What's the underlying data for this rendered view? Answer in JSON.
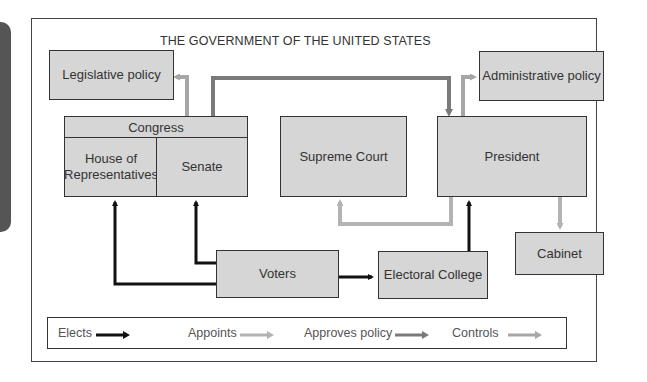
{
  "diagram": {
    "title": "THE GOVERNMENT OF THE UNITED STATES",
    "nodes": {
      "legislative_policy": "Legislative policy",
      "administrative_policy": "Administrative policy",
      "congress": "Congress",
      "house": "House of Representatives",
      "house_line1": "House of",
      "house_line2": "Representatives",
      "senate": "Senate",
      "supreme_court": "Supreme Court",
      "president": "President",
      "cabinet": "Cabinet",
      "voters": "Voters",
      "electoral_college": "Electoral College"
    },
    "edges": [
      {
        "from": "Voters",
        "to": "House of Representatives",
        "type": "Elects"
      },
      {
        "from": "Voters",
        "to": "Senate",
        "type": "Elects"
      },
      {
        "from": "Voters",
        "to": "Electoral College",
        "type": "Elects"
      },
      {
        "from": "Electoral College",
        "to": "President",
        "type": "Elects"
      },
      {
        "from": "President",
        "to": "Supreme Court",
        "type": "Appoints"
      },
      {
        "from": "President",
        "to": "Cabinet",
        "type": "Appoints"
      },
      {
        "from": "Senate",
        "to": "President",
        "type": "Approves policy"
      },
      {
        "from": "Congress",
        "to": "Legislative policy",
        "type": "Controls"
      },
      {
        "from": "President",
        "to": "Administrative policy",
        "type": "Controls"
      }
    ],
    "legend": [
      {
        "label": "Elects",
        "color": "#111111"
      },
      {
        "label": "Appoints",
        "color": "#b3b3b3"
      },
      {
        "label": "Approves policy",
        "color": "#7a7a7a"
      },
      {
        "label": "Controls",
        "color": "#a6a6a6"
      }
    ]
  },
  "colors": {
    "box_fill": "#d6d6d6",
    "border": "#333333",
    "elects": "#111111",
    "appoints": "#b3b3b3",
    "approves_policy": "#7a7a7a",
    "controls": "#a6a6a6"
  }
}
